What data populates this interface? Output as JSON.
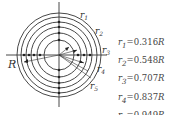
{
  "diagram": {
    "outer_label": "R",
    "ring_labels": [
      "r1",
      "r2",
      "r3",
      "r4",
      "r5"
    ],
    "ring_labels_display": [
      {
        "base": "r",
        "sub": "1"
      },
      {
        "base": "r",
        "sub": "2"
      },
      {
        "base": "r",
        "sub": "3"
      },
      {
        "base": "r",
        "sub": "4"
      },
      {
        "base": "r",
        "sub": "5"
      }
    ]
  },
  "formulas": [
    {
      "var": "r",
      "sub": "1",
      "eq": "=",
      "value": "0.316",
      "unit": "R"
    },
    {
      "var": "r",
      "sub": "2",
      "eq": "=",
      "value": "0.548",
      "unit": "R"
    },
    {
      "var": "r",
      "sub": "3",
      "eq": "=",
      "value": "0.707",
      "unit": "R"
    },
    {
      "var": "r",
      "sub": "4",
      "eq": "=",
      "value": "0.837",
      "unit": "R"
    },
    {
      "var": "r",
      "sub": "5",
      "eq": "=",
      "value": "0.949",
      "unit": "R"
    }
  ],
  "colors": {
    "stroke": "#333333",
    "background": "#ffffff"
  }
}
